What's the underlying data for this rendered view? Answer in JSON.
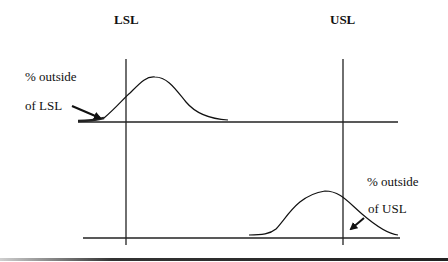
{
  "limits": {
    "lsl_label": "LSL",
    "usl_label": "USL"
  },
  "annotations": {
    "lsl_line1": "% outside",
    "lsl_line2": "of LSL",
    "usl_line1": "% outside",
    "usl_line2": "of USL"
  },
  "colors": {
    "ink": "#111111",
    "background": "#ffffff"
  }
}
